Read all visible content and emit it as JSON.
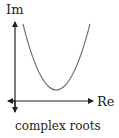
{
  "diagram": {
    "y_axis_label": "Im",
    "x_axis_label": "Re",
    "caption": "complex roots",
    "curve": "upward parabola entirely above the real axis (no real-axis crossing)",
    "colors": {
      "axis": "#231f20",
      "curve": "#6d6e71",
      "text": "#231f20"
    }
  }
}
